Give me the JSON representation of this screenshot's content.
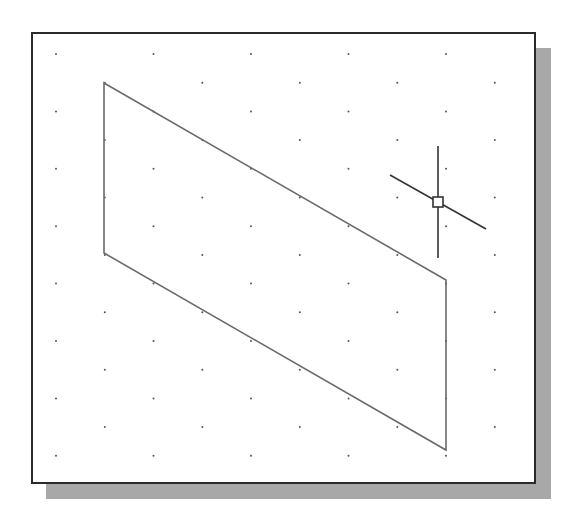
{
  "viewport": {
    "type": "isometric-drawing-area",
    "background": "#ffffff",
    "frame_color": "#2a2a2a",
    "shadow_color": "#a8a8a8"
  },
  "grid": {
    "style": "isometric-dots",
    "dot_color": "#555555",
    "origin_x": 56,
    "origin_y": 54,
    "pitch_x": 97.5,
    "pitch_y": 28.7,
    "rows": 15,
    "cols": 6
  },
  "shapes": [
    {
      "type": "parallelogram",
      "label": "isometric-plane",
      "stroke": "#6a6a6a",
      "points": [
        [
          104,
          83
        ],
        [
          446,
          280
        ],
        [
          446,
          450
        ],
        [
          104,
          253
        ]
      ]
    }
  ],
  "cursor": {
    "type": "isometric-crosshair",
    "center": [
      438,
      202
    ],
    "pickbox_size": 10,
    "vertical": [
      [
        438,
        146
      ],
      [
        438,
        258
      ]
    ],
    "diagonal": [
      [
        390,
        175
      ],
      [
        486,
        229
      ]
    ],
    "color": "#333333"
  }
}
